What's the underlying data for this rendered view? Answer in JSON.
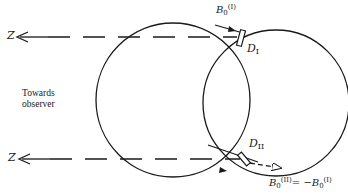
{
  "figure": {
    "axis_label_top": "Z",
    "axis_label_bottom": "Z",
    "observer_label_line1": "Towards",
    "observer_label_line2": "observer",
    "detector_top": {
      "symbol": "D",
      "subscript": "I"
    },
    "detector_bottom": {
      "symbol": "D",
      "subscript": "II"
    },
    "field_top": {
      "symbol": "B",
      "subscript": "0",
      "superscript": "(I)"
    },
    "field_bottom": {
      "lhs_symbol": "B",
      "lhs_subscript": "0",
      "lhs_superscript": "(II)",
      "equals": "= −",
      "rhs_symbol": "B",
      "rhs_subscript": "0",
      "rhs_superscript": "(I)"
    },
    "line_color": "#1a1a1a"
  }
}
